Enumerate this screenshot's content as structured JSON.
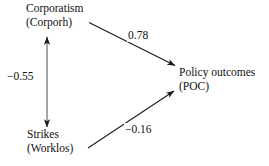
{
  "diagram": {
    "type": "path-diagram",
    "background_color": "#ffffff",
    "line_color": "#1a1a1a",
    "text_color": "#111111",
    "nodes": [
      {
        "id": "corporatism",
        "name": "Corporatism",
        "abbrev": "(Corporh)",
        "position": "top-left"
      },
      {
        "id": "policy_outcomes",
        "name": "Policy outcomes",
        "abbrev": "(POC)",
        "position": "right"
      },
      {
        "id": "strikes",
        "name": "Strikes",
        "abbrev": "(Worklos)",
        "position": "bottom-left"
      }
    ],
    "edges": [
      {
        "id": "corporatism-to-poc",
        "from": "corporatism",
        "to": "policy_outcomes",
        "coefficient": "0.78",
        "arrow": "single",
        "direction": "down-right"
      },
      {
        "id": "corporatism-strikes",
        "from": "corporatism",
        "to": "strikes",
        "coefficient": "−0.55",
        "arrow": "double",
        "direction": "vertical"
      },
      {
        "id": "strikes-to-poc",
        "from": "strikes",
        "to": "policy_outcomes",
        "coefficient": "−0.16",
        "arrow": "single",
        "direction": "up-right"
      }
    ]
  }
}
